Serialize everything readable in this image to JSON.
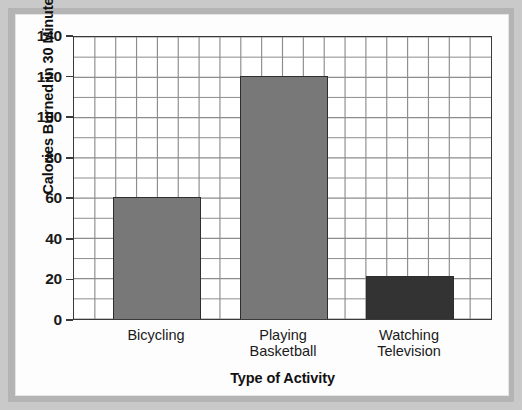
{
  "chart_data": {
    "type": "bar",
    "title": "",
    "xlabel": "Type of Activity",
    "ylabel": "Calories Burned in 30 Minutes",
    "categories": [
      "Bicycling",
      "Playing\nBasketball",
      "Watching\nTelevision"
    ],
    "values": [
      60,
      120,
      21
    ],
    "ylim": [
      0,
      140
    ],
    "ytick_labels": [
      "0",
      "20",
      "40",
      "60",
      "80",
      "100",
      "120",
      "140"
    ],
    "ytick_values": [
      0,
      20,
      40,
      60,
      80,
      100,
      120,
      140
    ],
    "grid": true,
    "grid_minor_step_y": 10,
    "grid_columns_x": 20,
    "legend": "none",
    "bar_colors": [
      "#787878",
      "#787878",
      "#333333"
    ],
    "bar_edge_color": "#2e2e2e",
    "axis_color": "#3a3a3a",
    "grid_color": "#8c8c8c",
    "plot_background": "#ffffff",
    "page_background": "#fdfdfd",
    "frame_color": "#b4b4b4"
  }
}
